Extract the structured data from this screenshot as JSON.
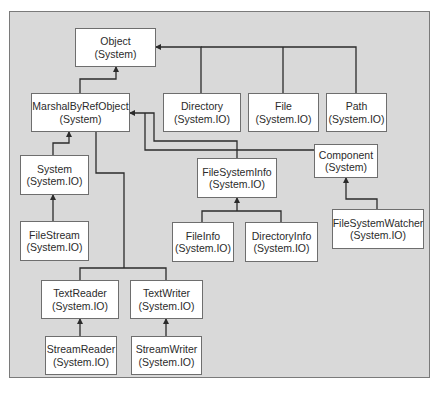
{
  "diagram": {
    "colors": {
      "panel": "#d9d9d9",
      "box": "#ffffff",
      "line": "#2b2b2b",
      "text": "#2b2b2b"
    },
    "nodes": [
      {
        "id": "object",
        "name": "Object",
        "ns": "(System)"
      },
      {
        "id": "marshal",
        "name": "MarshalByRefObject",
        "ns": "(System)"
      },
      {
        "id": "directory",
        "name": "Directory",
        "ns": "(System.IO)"
      },
      {
        "id": "file",
        "name": "File",
        "ns": "(System.IO)"
      },
      {
        "id": "path",
        "name": "Path",
        "ns": "(System.IO)"
      },
      {
        "id": "system",
        "name": "System",
        "ns": "(System.IO)"
      },
      {
        "id": "filesysteminfo",
        "name": "FileSystemInfo",
        "ns": "(System.IO)"
      },
      {
        "id": "component",
        "name": "Component",
        "ns": "(System)"
      },
      {
        "id": "filestream",
        "name": "FileStream",
        "ns": "(System.IO)"
      },
      {
        "id": "fileinfo",
        "name": "FileInfo",
        "ns": "(System.IO)"
      },
      {
        "id": "directoryinfo",
        "name": "DirectoryInfo",
        "ns": "(System.IO)"
      },
      {
        "id": "filesystemwatcher",
        "name": "FileSystemWatcher",
        "ns": "(System.IO)"
      },
      {
        "id": "textreader",
        "name": "TextReader",
        "ns": "(System.IO)"
      },
      {
        "id": "textwriter",
        "name": "TextWriter",
        "ns": "(System.IO)"
      },
      {
        "id": "streamreader",
        "name": "StreamReader",
        "ns": "(System.IO)"
      },
      {
        "id": "streamwriter",
        "name": "StreamWriter",
        "ns": "(System.IO)"
      }
    ],
    "edges": [
      {
        "from": "MarshalByRefObject",
        "to": "Object"
      },
      {
        "from": "Directory",
        "to": "Object"
      },
      {
        "from": "File",
        "to": "Object"
      },
      {
        "from": "Path",
        "to": "Object"
      },
      {
        "from": "System",
        "to": "MarshalByRefObject"
      },
      {
        "from": "FileSystemInfo",
        "to": "MarshalByRefObject"
      },
      {
        "from": "Component",
        "to": "MarshalByRefObject"
      },
      {
        "from": "TextReader",
        "to": "MarshalByRefObject"
      },
      {
        "from": "TextWriter",
        "to": "MarshalByRefObject"
      },
      {
        "from": "FileStream",
        "to": "System"
      },
      {
        "from": "FileInfo",
        "to": "FileSystemInfo"
      },
      {
        "from": "DirectoryInfo",
        "to": "FileSystemInfo"
      },
      {
        "from": "FileSystemWatcher",
        "to": "Component"
      },
      {
        "from": "StreamReader",
        "to": "TextReader"
      },
      {
        "from": "StreamWriter",
        "to": "TextWriter"
      }
    ]
  }
}
